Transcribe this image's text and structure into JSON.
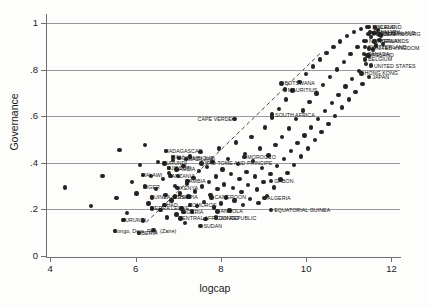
{
  "chart_data": {
    "type": "scatter",
    "title": "",
    "xlabel": "logcap",
    "ylabel": "Governance",
    "xlim": [
      3.9,
      12.2
    ],
    "ylim": [
      0,
      1.04
    ],
    "xticks": [
      "4",
      "6",
      "8",
      "10",
      "12"
    ],
    "xtick_values": [
      4,
      6,
      8,
      10,
      12
    ],
    "yticks": [
      "0",
      ".2",
      ".4",
      ".6",
      ".8",
      "1"
    ],
    "ytick_values": [
      0,
      0.2,
      0.4,
      0.6,
      0.8,
      1
    ],
    "grid": "horizontal",
    "legend": "none",
    "trendline": {
      "style": "dashed",
      "x0": 6.25,
      "y0": 0.145,
      "x1": 10.35,
      "y1": 0.875
    },
    "points": [
      {
        "x": 4.35,
        "y": 0.295
      },
      {
        "x": 4.95,
        "y": 0.215
      },
      {
        "x": 5.22,
        "y": 0.345
      },
      {
        "x": 5.55,
        "y": 0.248
      },
      {
        "x": 5.62,
        "y": 0.455
      },
      {
        "x": 5.8,
        "y": 0.185
      },
      {
        "x": 5.92,
        "y": 0.318
      },
      {
        "x": 6.02,
        "y": 0.268
      },
      {
        "x": 6.1,
        "y": 0.392
      },
      {
        "x": 6.18,
        "y": 0.152
      },
      {
        "x": 6.22,
        "y": 0.478
      },
      {
        "x": 6.3,
        "y": 0.225
      },
      {
        "x": 6.36,
        "y": 0.345
      },
      {
        "x": 6.42,
        "y": 0.112
      },
      {
        "x": 6.48,
        "y": 0.288
      },
      {
        "x": 6.52,
        "y": 0.405
      },
      {
        "x": 6.58,
        "y": 0.198
      },
      {
        "x": 6.64,
        "y": 0.332
      },
      {
        "x": 6.7,
        "y": 0.262
      },
      {
        "x": 6.74,
        "y": 0.165
      },
      {
        "x": 6.78,
        "y": 0.358
      },
      {
        "x": 6.84,
        "y": 0.238
      },
      {
        "x": 6.88,
        "y": 0.412
      },
      {
        "x": 6.92,
        "y": 0.302
      },
      {
        "x": 6.96,
        "y": 0.178
      },
      {
        "x": 7.0,
        "y": 0.345
      },
      {
        "x": 7.04,
        "y": 0.268
      },
      {
        "x": 7.08,
        "y": 0.205
      },
      {
        "x": 7.12,
        "y": 0.388
      },
      {
        "x": 7.16,
        "y": 0.142
      },
      {
        "x": 7.2,
        "y": 0.312
      },
      {
        "x": 7.24,
        "y": 0.255
      },
      {
        "x": 7.28,
        "y": 0.428
      },
      {
        "x": 7.32,
        "y": 0.192
      },
      {
        "x": 7.36,
        "y": 0.335
      },
      {
        "x": 7.4,
        "y": 0.278
      },
      {
        "x": 7.44,
        "y": 0.215
      },
      {
        "x": 7.48,
        "y": 0.365
      },
      {
        "x": 7.52,
        "y": 0.448
      },
      {
        "x": 7.56,
        "y": 0.298
      },
      {
        "x": 7.6,
        "y": 0.232
      },
      {
        "x": 7.64,
        "y": 0.158
      },
      {
        "x": 7.68,
        "y": 0.382
      },
      {
        "x": 7.72,
        "y": 0.318
      },
      {
        "x": 7.76,
        "y": 0.262
      },
      {
        "x": 7.8,
        "y": 0.405
      },
      {
        "x": 7.84,
        "y": 0.208
      },
      {
        "x": 7.88,
        "y": 0.342
      },
      {
        "x": 7.92,
        "y": 0.288
      },
      {
        "x": 7.96,
        "y": 0.462
      },
      {
        "x": 8.0,
        "y": 0.225
      },
      {
        "x": 8.04,
        "y": 0.372
      },
      {
        "x": 8.08,
        "y": 0.308
      },
      {
        "x": 8.12,
        "y": 0.252
      },
      {
        "x": 8.16,
        "y": 0.418
      },
      {
        "x": 8.2,
        "y": 0.195
      },
      {
        "x": 8.24,
        "y": 0.352
      },
      {
        "x": 8.28,
        "y": 0.292
      },
      {
        "x": 8.32,
        "y": 0.238
      },
      {
        "x": 8.36,
        "y": 0.488
      },
      {
        "x": 8.4,
        "y": 0.395
      },
      {
        "x": 8.44,
        "y": 0.332
      },
      {
        "x": 8.48,
        "y": 0.275
      },
      {
        "x": 8.52,
        "y": 0.218
      },
      {
        "x": 8.56,
        "y": 0.438
      },
      {
        "x": 8.6,
        "y": 0.362
      },
      {
        "x": 8.64,
        "y": 0.305
      },
      {
        "x": 8.68,
        "y": 0.245
      },
      {
        "x": 8.72,
        "y": 0.512
      },
      {
        "x": 8.76,
        "y": 0.408
      },
      {
        "x": 8.8,
        "y": 0.342
      },
      {
        "x": 8.84,
        "y": 0.285
      },
      {
        "x": 8.88,
        "y": 0.228
      },
      {
        "x": 8.92,
        "y": 0.462
      },
      {
        "x": 8.96,
        "y": 0.378
      },
      {
        "x": 9.0,
        "y": 0.318
      },
      {
        "x": 9.04,
        "y": 0.552
      },
      {
        "x": 9.08,
        "y": 0.258
      },
      {
        "x": 9.12,
        "y": 0.432
      },
      {
        "x": 9.16,
        "y": 0.352
      },
      {
        "x": 9.2,
        "y": 0.595
      },
      {
        "x": 9.24,
        "y": 0.295
      },
      {
        "x": 9.28,
        "y": 0.478
      },
      {
        "x": 9.32,
        "y": 0.388
      },
      {
        "x": 9.36,
        "y": 0.632
      },
      {
        "x": 9.4,
        "y": 0.328
      },
      {
        "x": 9.44,
        "y": 0.512
      },
      {
        "x": 9.48,
        "y": 0.418
      },
      {
        "x": 9.52,
        "y": 0.672
      },
      {
        "x": 9.56,
        "y": 0.358
      },
      {
        "x": 9.6,
        "y": 0.548
      },
      {
        "x": 9.64,
        "y": 0.452
      },
      {
        "x": 9.68,
        "y": 0.712
      },
      {
        "x": 9.72,
        "y": 0.392
      },
      {
        "x": 9.76,
        "y": 0.588
      },
      {
        "x": 9.8,
        "y": 0.485
      },
      {
        "x": 9.84,
        "y": 0.748
      },
      {
        "x": 9.88,
        "y": 0.428
      },
      {
        "x": 9.92,
        "y": 0.625
      },
      {
        "x": 9.96,
        "y": 0.518
      },
      {
        "x": 10.0,
        "y": 0.782
      },
      {
        "x": 10.04,
        "y": 0.462
      },
      {
        "x": 10.08,
        "y": 0.662
      },
      {
        "x": 10.12,
        "y": 0.552
      },
      {
        "x": 10.16,
        "y": 0.815
      },
      {
        "x": 10.2,
        "y": 0.498
      },
      {
        "x": 10.24,
        "y": 0.698
      },
      {
        "x": 10.28,
        "y": 0.588
      },
      {
        "x": 10.32,
        "y": 0.845
      },
      {
        "x": 10.36,
        "y": 0.532
      },
      {
        "x": 10.4,
        "y": 0.735
      },
      {
        "x": 10.44,
        "y": 0.622
      },
      {
        "x": 10.48,
        "y": 0.872
      },
      {
        "x": 10.52,
        "y": 0.568
      },
      {
        "x": 10.56,
        "y": 0.768
      },
      {
        "x": 10.6,
        "y": 0.658
      },
      {
        "x": 10.64,
        "y": 0.898
      },
      {
        "x": 10.68,
        "y": 0.602
      },
      {
        "x": 10.72,
        "y": 0.802
      },
      {
        "x": 10.76,
        "y": 0.692
      },
      {
        "x": 10.8,
        "y": 0.922
      },
      {
        "x": 10.84,
        "y": 0.638
      },
      {
        "x": 10.88,
        "y": 0.835
      },
      {
        "x": 10.92,
        "y": 0.728
      },
      {
        "x": 10.96,
        "y": 0.945
      },
      {
        "x": 11.0,
        "y": 0.672
      },
      {
        "x": 11.04,
        "y": 0.868
      },
      {
        "x": 11.08,
        "y": 0.762
      },
      {
        "x": 11.12,
        "y": 0.962
      },
      {
        "x": 11.16,
        "y": 0.705
      },
      {
        "x": 11.2,
        "y": 0.898
      },
      {
        "x": 11.24,
        "y": 0.795
      },
      {
        "x": 11.28,
        "y": 0.975
      },
      {
        "x": 11.32,
        "y": 0.738
      },
      {
        "x": 11.36,
        "y": 0.925
      },
      {
        "x": 11.4,
        "y": 0.825
      },
      {
        "x": 11.44,
        "y": 0.985
      },
      {
        "x": 11.48,
        "y": 0.862
      },
      {
        "x": 11.52,
        "y": 0.942
      },
      {
        "x": 11.56,
        "y": 0.888
      },
      {
        "x": 11.6,
        "y": 0.958
      },
      {
        "x": 11.64,
        "y": 0.905
      },
      {
        "x": 11.68,
        "y": 0.972
      },
      {
        "x": 11.72,
        "y": 0.928
      },
      {
        "x": 11.76,
        "y": 0.948
      },
      {
        "x": 11.8,
        "y": 0.912
      }
    ],
    "labeled_points": [
      {
        "label": "FINLAND",
        "x": 11.48,
        "y": 0.985,
        "dx": 3,
        "dy": -2
      },
      {
        "label": "ICELAND",
        "x": 11.62,
        "y": 0.982,
        "dx": 3,
        "dy": -2
      },
      {
        "label": "DENMARK",
        "x": 11.5,
        "y": 0.962,
        "dx": 3,
        "dy": -2
      },
      {
        "label": "NEW ZEALAND",
        "x": 11.58,
        "y": 0.958,
        "dx": 3,
        "dy": -2
      },
      {
        "label": "SWEDEN",
        "x": 11.46,
        "y": 0.955,
        "dx": 3,
        "dy": -2
      },
      {
        "label": "LUXEMBOURG",
        "x": 11.72,
        "y": 0.952,
        "dx": 3,
        "dy": -2
      },
      {
        "label": "NETHERLANDS",
        "x": 11.4,
        "y": 0.925,
        "dx": 3,
        "dy": -2
      },
      {
        "label": "NORWAY",
        "x": 11.6,
        "y": 0.922,
        "dx": 3,
        "dy": -2
      },
      {
        "label": "SWITZERLAND",
        "x": 11.38,
        "y": 0.898,
        "dx": 3,
        "dy": -2
      },
      {
        "label": "UNITED KINGDOM",
        "x": 11.48,
        "y": 0.892,
        "dx": 3,
        "dy": -2
      },
      {
        "label": "CANADA",
        "x": 11.36,
        "y": 0.868,
        "dx": 3,
        "dy": -2
      },
      {
        "label": "IRELAND",
        "x": 11.44,
        "y": 0.862,
        "dx": 3,
        "dy": -2
      },
      {
        "label": "BELGIUM",
        "x": 11.38,
        "y": 0.845,
        "dx": 3,
        "dy": -2
      },
      {
        "label": "UNITED STATES",
        "x": 11.52,
        "y": 0.818,
        "dx": 3,
        "dy": -2
      },
      {
        "label": "HONG KONG",
        "x": 11.3,
        "y": 0.785,
        "dx": 3,
        "dy": -2
      },
      {
        "label": "JAPAN",
        "x": 11.48,
        "y": 0.768,
        "dx": 3,
        "dy": -2
      },
      {
        "label": "BOTSWANA",
        "x": 9.42,
        "y": 0.742,
        "dx": 3,
        "dy": -2
      },
      {
        "label": "MAURITIUS",
        "x": 9.5,
        "y": 0.715,
        "dx": 3,
        "dy": -2
      },
      {
        "label": "SOUTH AFRICA",
        "x": 9.2,
        "y": 0.608,
        "dx": 3,
        "dy": -2
      },
      {
        "label": "CAPE VERDE",
        "x": 8.32,
        "y": 0.588,
        "dx": -37,
        "dy": -2
      },
      {
        "label": "MADAGASCAR",
        "x": 6.72,
        "y": 0.452,
        "dx": -2,
        "dy": -2
      },
      {
        "label": "MALI",
        "x": 6.88,
        "y": 0.425,
        "dx": -2,
        "dy": -2
      },
      {
        "label": "MOZAMBIQUE",
        "x": 7.02,
        "y": 0.422,
        "dx": -2,
        "dy": -2
      },
      {
        "label": "SWAZILAND",
        "x": 7.18,
        "y": 0.418,
        "dx": -2,
        "dy": -2
      },
      {
        "label": "MOROCCO",
        "x": 8.55,
        "y": 0.425,
        "dx": 3,
        "dy": -2
      },
      {
        "label": "BURUNDI",
        "x": 6.68,
        "y": 0.398,
        "dx": -2,
        "dy": -2
      },
      {
        "label": "SAO TOME AND PRINCIPE",
        "x": 7.55,
        "y": 0.398,
        "dx": 3,
        "dy": -2
      },
      {
        "label": "DJIBOUTI",
        "x": 6.78,
        "y": 0.378,
        "dx": -2,
        "dy": -2
      },
      {
        "label": "GAMBIA",
        "x": 6.96,
        "y": 0.372,
        "dx": -2,
        "dy": -2
      },
      {
        "label": "MALAWI",
        "x": 6.18,
        "y": 0.348,
        "dx": -2,
        "dy": -2
      },
      {
        "label": "TANZANIA",
        "x": 6.82,
        "y": 0.345,
        "dx": -2,
        "dy": -2
      },
      {
        "label": "ZAMBIA",
        "x": 7.22,
        "y": 0.322,
        "dx": -2,
        "dy": -2
      },
      {
        "label": "NIGER",
        "x": 6.22,
        "y": 0.298,
        "dx": -2,
        "dy": -2
      },
      {
        "label": "KENYA",
        "x": 6.98,
        "y": 0.292,
        "dx": 3,
        "dy": -2
      },
      {
        "label": "GABON",
        "x": 9.18,
        "y": 0.322,
        "dx": 3,
        "dy": -2
      },
      {
        "label": "GUINEA-BISSAU",
        "x": 6.38,
        "y": 0.252,
        "dx": -2,
        "dy": -2
      },
      {
        "label": "ETHIOPIA",
        "x": 6.92,
        "y": 0.255,
        "dx": -2,
        "dy": -2
      },
      {
        "label": "CAMEROON",
        "x": 7.78,
        "y": 0.252,
        "dx": 3,
        "dy": -2
      },
      {
        "label": "ALGERIA",
        "x": 9.02,
        "y": 0.248,
        "dx": 3,
        "dy": -2
      },
      {
        "label": "CHAD",
        "x": 6.68,
        "y": 0.218,
        "dx": -2,
        "dy": -2
      },
      {
        "label": "COMOROS",
        "x": 7.28,
        "y": 0.218,
        "dx": -2,
        "dy": -2
      },
      {
        "label": "SIERRA LEONE",
        "x": 6.38,
        "y": 0.205,
        "dx": -2,
        "dy": -2
      },
      {
        "label": "NIGERIA",
        "x": 7.12,
        "y": 0.188,
        "dx": -2,
        "dy": -2
      },
      {
        "label": "ANGOLA",
        "x": 7.92,
        "y": 0.192,
        "dx": 3,
        "dy": -2
      },
      {
        "label": "EQUATORIAL GUINEA",
        "x": 9.18,
        "y": 0.198,
        "dx": 3,
        "dy": -2
      },
      {
        "label": "CENTRAL AFRICAN REPUBLIC",
        "x": 7.05,
        "y": 0.162,
        "dx": -2,
        "dy": -2
      },
      {
        "label": "CONGO",
        "x": 7.88,
        "y": 0.165,
        "dx": 3,
        "dy": -2
      },
      {
        "label": "BURUNDI ",
        "x": 5.72,
        "y": 0.155,
        "dx": -2,
        "dy": -2
      },
      {
        "label": "SUDAN",
        "x": 7.52,
        "y": 0.128,
        "dx": 3,
        "dy": -2
      },
      {
        "label": "Congo, Dem. Rep. (Zaire)",
        "x": 5.52,
        "y": 0.108,
        "dx": -2,
        "dy": -2,
        "mixed": true
      },
      {
        "label": "LIBERIA",
        "x": 6.08,
        "y": 0.098,
        "dx": -2,
        "dy": -2
      }
    ]
  }
}
